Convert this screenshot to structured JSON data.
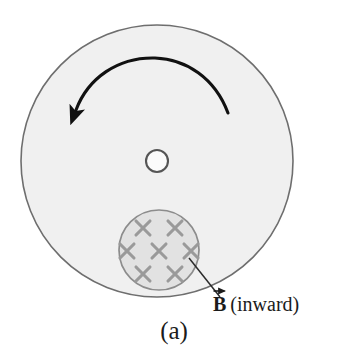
{
  "figure": {
    "caption": "(a)"
  },
  "colors": {
    "page_background": "#ffffff",
    "disk_fill": "#f0f0f0",
    "disk_stroke": "#6e6e6e",
    "field_region_fill": "#e2e2e2",
    "field_region_stroke": "#8c8c8c",
    "cross_mark": "#9a9a9a",
    "hub_fill": "#fbfbfb",
    "hub_stroke": "#555555",
    "rotation_arrow": "#111111",
    "leader_line": "#2b2b2b",
    "label_text": "#1b1b1b"
  },
  "disk": {
    "name": "rotating-disk",
    "center_x": 157,
    "center_y": 161,
    "radius": 136
  },
  "hub": {
    "name": "disk-axle-hole",
    "center_x": 157,
    "center_y": 161,
    "radius": 11
  },
  "rotation_arrow": {
    "name": "counterclockwise-rotation-arrow",
    "direction": "counterclockwise",
    "arrowhead_at": "left",
    "tail_x": 228,
    "tail_y": 113,
    "head_x": 76,
    "head_y": 110
  },
  "field_region": {
    "name": "magnetic-field-region",
    "center_x": 159,
    "center_y": 250,
    "radius": 40,
    "field_direction": "into the page",
    "cross_count": 7,
    "crosses": [
      {
        "x": 143,
        "y": 228
      },
      {
        "x": 175,
        "y": 228
      },
      {
        "x": 127,
        "y": 251
      },
      {
        "x": 159,
        "y": 251
      },
      {
        "x": 191,
        "y": 251
      },
      {
        "x": 143,
        "y": 274
      },
      {
        "x": 175,
        "y": 274
      }
    ],
    "cross_half_size": 10
  },
  "leader_line": {
    "name": "field-label-leader-line",
    "x1": 189,
    "y1": 258,
    "x2": 220,
    "y2": 297
  },
  "field_label": {
    "symbol": "B",
    "vector_notation": "arrow-over",
    "text": "(inward)"
  }
}
